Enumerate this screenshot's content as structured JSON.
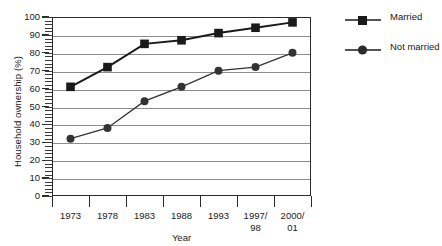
{
  "chart_data": {
    "type": "line",
    "title": "",
    "xlabel": "Year",
    "ylabel": "Household ownership (%)",
    "categories": [
      "1973",
      "1978",
      "1983",
      "1988",
      "1993",
      "1997/\n98",
      "2000/\n01"
    ],
    "category_labels": [
      {
        "line1": "1973",
        "line2": ""
      },
      {
        "line1": "1978",
        "line2": ""
      },
      {
        "line1": "1983",
        "line2": ""
      },
      {
        "line1": "1988",
        "line2": ""
      },
      {
        "line1": "1993",
        "line2": ""
      },
      {
        "line1": "1997/",
        "line2": "98"
      },
      {
        "line1": "2000/",
        "line2": "01"
      }
    ],
    "series": [
      {
        "name": "Married",
        "marker": "square",
        "color": "#1a1a1a",
        "values": [
          61,
          72,
          85,
          87,
          91,
          94,
          97
        ]
      },
      {
        "name": "Not married",
        "marker": "circle",
        "color": "#333333",
        "values": [
          32,
          38,
          53,
          61,
          70,
          72,
          80
        ]
      }
    ],
    "ylim": [
      0,
      100
    ],
    "ytick_step": 10,
    "yticks": [
      0,
      10,
      20,
      30,
      40,
      50,
      60,
      70,
      80,
      90,
      100
    ],
    "ytick_minor_step": 2,
    "grid": "horizontal",
    "grid_color": "#8d8d8d",
    "legend_position": "right",
    "axis_color": "#2b2b2b"
  },
  "legend": {
    "entries": [
      {
        "label": "Married",
        "marker": "square"
      },
      {
        "label": "Not married",
        "marker": "circle"
      }
    ]
  }
}
